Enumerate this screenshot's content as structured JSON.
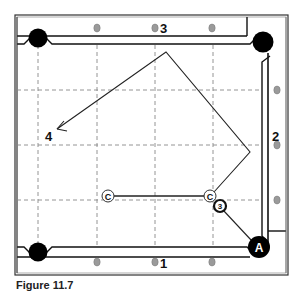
{
  "diagram": {
    "type": "billiards-table-shot",
    "rail_labels": {
      "rail_1": "1",
      "rail_2": "2",
      "rail_3": "3",
      "end_label": "4"
    },
    "balls": {
      "cue_ball_start": "C",
      "cue_ball_contact": "C",
      "object_ball": "3",
      "target_pocket": "A"
    },
    "colors": {
      "pocket": "#000000",
      "diamond": "#9a9a9a",
      "grid": "#888888",
      "path": "#222222"
    }
  },
  "caption": "Figure 11.7"
}
